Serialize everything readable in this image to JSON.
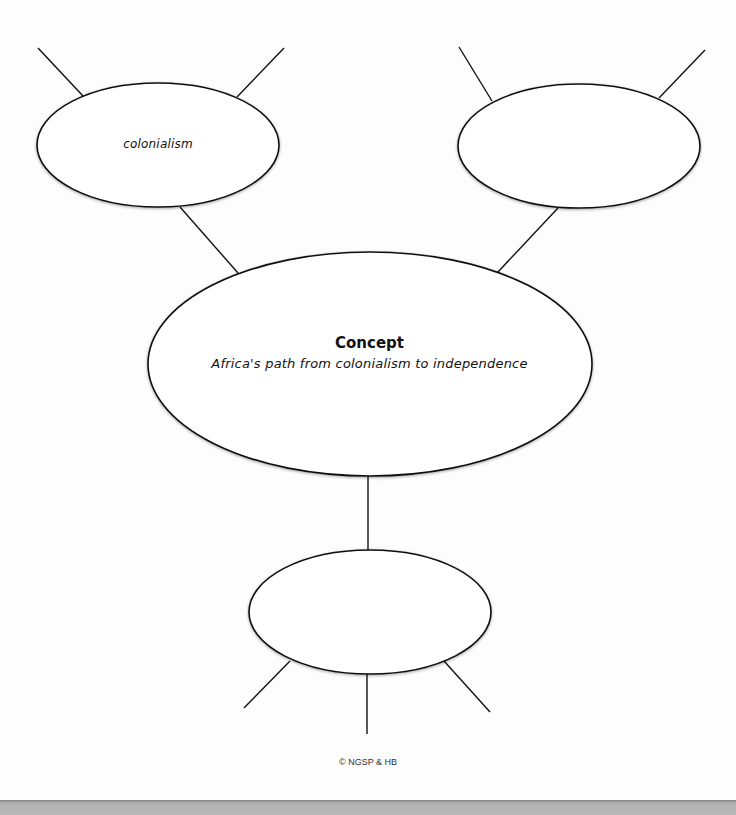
{
  "diagram": {
    "type": "concept web",
    "center_node": {
      "title": "Concept",
      "subtitle": "Africa's path from colonialism to independence"
    },
    "nodes": {
      "top_left": {
        "label": "colonialism"
      },
      "top_right": {
        "label": ""
      },
      "bottom": {
        "label": ""
      }
    },
    "spokes": {
      "top_left": 2,
      "top_right": 2,
      "bottom": 3
    }
  },
  "footer": {
    "copyright": "© NGSP & HB"
  },
  "colors": {
    "line": "#111111",
    "background": "#ffffff",
    "bottom_bar": "#b5b5b5"
  }
}
